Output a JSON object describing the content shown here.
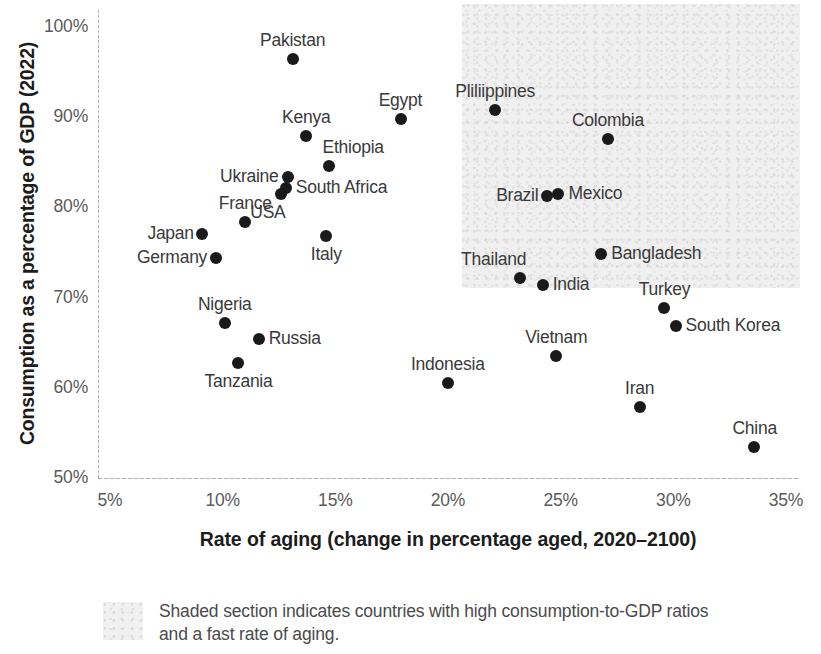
{
  "chart_data": {
    "type": "scatter",
    "title": "",
    "xlabel": "Rate of aging (change in percentage aged, 2020–2100)",
    "ylabel": "Consumption as a percentage of GDP (2022)",
    "xlim": [
      5,
      35
    ],
    "ylim": [
      50,
      100
    ],
    "xticks": [
      "5%",
      "10%",
      "15%",
      "20%",
      "25%",
      "30%",
      "35%"
    ],
    "xtick_values": [
      5,
      10,
      15,
      20,
      25,
      30,
      35
    ],
    "yticks": [
      "50%",
      "60%",
      "70%",
      "80%",
      "90%",
      "100%"
    ],
    "ytick_values": [
      50,
      60,
      70,
      80,
      90,
      100
    ],
    "grid": false,
    "legend_position": "below-plot",
    "point_color": "#1a1a1a",
    "shade_color": "#f0f0f0",
    "shaded_region": {
      "x_range": [
        21.2,
        36.1
      ],
      "y_range": [
        69.5,
        100.5
      ],
      "note": "Shaded section indicates countries with high consumption-to-GDP ratios and a fast rate of aging."
    },
    "points": [
      {
        "label": "Pakistan",
        "x": 13.1,
        "y": 96.4,
        "label_pos": "top"
      },
      {
        "label": "Egypt",
        "x": 17.9,
        "y": 89.8,
        "label_pos": "top"
      },
      {
        "label": "Kenya",
        "x": 13.7,
        "y": 87.9,
        "label_pos": "top"
      },
      {
        "label": "Ethiopia",
        "x": 14.7,
        "y": 84.6,
        "label_pos": "top-right"
      },
      {
        "label": "Ukraine",
        "x": 12.9,
        "y": 83.4,
        "label_pos": "left"
      },
      {
        "label": "South Africa",
        "x": 12.8,
        "y": 82.2,
        "label_pos": "right"
      },
      {
        "label": "USA",
        "x": 12.6,
        "y": 81.5,
        "label_pos": "bottom-left"
      },
      {
        "label": "France",
        "x": 11.0,
        "y": 78.4,
        "label_pos": "top"
      },
      {
        "label": "Japan",
        "x": 9.1,
        "y": 77.0,
        "label_pos": "left"
      },
      {
        "label": "Italy",
        "x": 14.6,
        "y": 76.8,
        "label_pos": "bottom"
      },
      {
        "label": "Germany",
        "x": 9.7,
        "y": 74.4,
        "label_pos": "left"
      },
      {
        "label": "Nigeria",
        "x": 10.1,
        "y": 67.2,
        "label_pos": "top"
      },
      {
        "label": "Russia",
        "x": 11.6,
        "y": 65.4,
        "label_pos": "right"
      },
      {
        "label": "Tanzania",
        "x": 10.7,
        "y": 62.8,
        "label_pos": "bottom"
      },
      {
        "label": "Indonesia",
        "x": 20.0,
        "y": 60.5,
        "label_pos": "top"
      },
      {
        "label": "Pliliippines",
        "x": 22.1,
        "y": 90.8,
        "label_pos": "top"
      },
      {
        "label": "Colombia",
        "x": 27.1,
        "y": 87.6,
        "label_pos": "top"
      },
      {
        "label": "Brazil",
        "x": 24.4,
        "y": 81.3,
        "label_pos": "left"
      },
      {
        "label": "Mexico",
        "x": 24.9,
        "y": 81.5,
        "label_pos": "right"
      },
      {
        "label": "Bangladesh",
        "x": 26.8,
        "y": 74.8,
        "label_pos": "right"
      },
      {
        "label": "Thailand",
        "x": 23.2,
        "y": 72.2,
        "label_pos": "top-left"
      },
      {
        "label": "India",
        "x": 24.2,
        "y": 71.4,
        "label_pos": "right"
      },
      {
        "label": "Turkey",
        "x": 29.6,
        "y": 68.9,
        "label_pos": "top"
      },
      {
        "label": "South Korea",
        "x": 30.1,
        "y": 66.8,
        "label_pos": "right"
      },
      {
        "label": "Vietnam",
        "x": 24.8,
        "y": 63.5,
        "label_pos": "top"
      },
      {
        "label": "Iran",
        "x": 28.5,
        "y": 57.9,
        "label_pos": "top"
      },
      {
        "label": "China",
        "x": 33.6,
        "y": 53.4,
        "label_pos": "top"
      }
    ]
  },
  "legend": {
    "caption": "Shaded section indicates countries with high consumption-to-GDP ratios and a fast rate of aging."
  }
}
